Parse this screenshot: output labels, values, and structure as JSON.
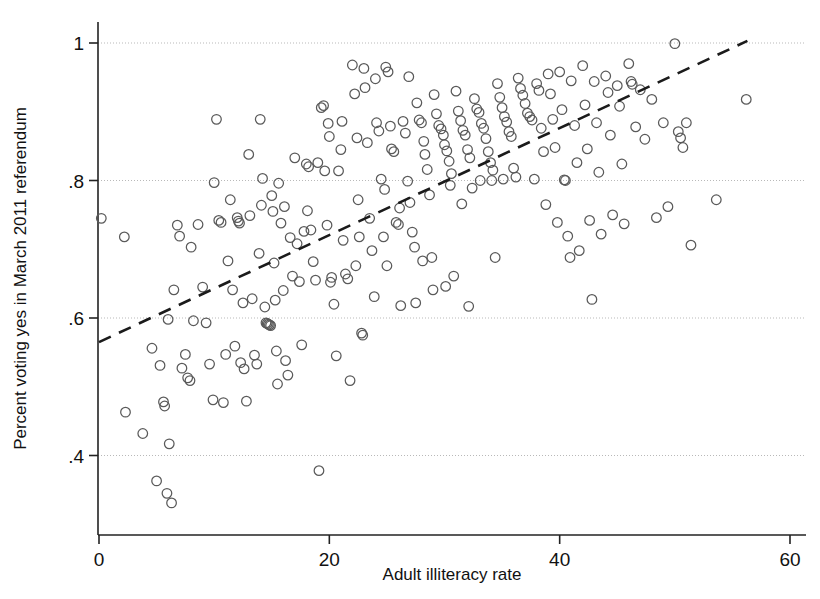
{
  "chart_data": {
    "type": "scatter",
    "title": "",
    "xlabel": "Adult illiteracy rate",
    "ylabel": "Percent voting yes in March 2011 referendum",
    "xlim": [
      -1.2,
      61.5
    ],
    "ylim": [
      0.305,
      1.02
    ],
    "xticks": [
      0,
      20,
      40,
      60
    ],
    "xtick_labels": [
      "0",
      "20",
      "40",
      "60"
    ],
    "yticks": [
      0.4,
      0.6,
      0.8,
      1.0
    ],
    "ytick_labels": [
      ".4",
      ".6",
      ".8",
      "1"
    ],
    "grid": "horizontal-dotted",
    "legend": "none",
    "marker": "open-circle",
    "marker_color": "#5a5a5a",
    "fit_line": {
      "style": "dashed",
      "color": "#1b1b1b",
      "x_start": 0.0,
      "y_start": 0.565,
      "x_end": 56.3,
      "y_end": 1.003
    },
    "points": [
      [
        0.2,
        0.745
      ],
      [
        2.2,
        0.718
      ],
      [
        2.3,
        0.463
      ],
      [
        3.8,
        0.432
      ],
      [
        4.6,
        0.556
      ],
      [
        5.0,
        0.363
      ],
      [
        5.3,
        0.531
      ],
      [
        5.6,
        0.478
      ],
      [
        5.7,
        0.472
      ],
      [
        5.9,
        0.345
      ],
      [
        6.0,
        0.598
      ],
      [
        6.1,
        0.417
      ],
      [
        6.3,
        0.331
      ],
      [
        6.5,
        0.641
      ],
      [
        6.8,
        0.735
      ],
      [
        7.0,
        0.719
      ],
      [
        7.2,
        0.527
      ],
      [
        7.5,
        0.547
      ],
      [
        7.7,
        0.513
      ],
      [
        7.9,
        0.509
      ],
      [
        8.0,
        0.703
      ],
      [
        8.2,
        0.596
      ],
      [
        8.6,
        0.736
      ],
      [
        9.0,
        0.645
      ],
      [
        9.3,
        0.593
      ],
      [
        9.6,
        0.533
      ],
      [
        9.9,
        0.481
      ],
      [
        10.0,
        0.797
      ],
      [
        10.2,
        0.889
      ],
      [
        10.4,
        0.742
      ],
      [
        10.6,
        0.739
      ],
      [
        10.8,
        0.477
      ],
      [
        11.0,
        0.547
      ],
      [
        11.2,
        0.683
      ],
      [
        11.4,
        0.772
      ],
      [
        11.6,
        0.641
      ],
      [
        11.8,
        0.559
      ],
      [
        12.0,
        0.746
      ],
      [
        12.2,
        0.738
      ],
      [
        12.3,
        0.535
      ],
      [
        12.5,
        0.622
      ],
      [
        12.6,
        0.526
      ],
      [
        12.8,
        0.479
      ],
      [
        13.0,
        0.838
      ],
      [
        13.1,
        0.749
      ],
      [
        13.3,
        0.628
      ],
      [
        13.5,
        0.546
      ],
      [
        13.7,
        0.533
      ],
      [
        13.9,
        0.694
      ],
      [
        14.0,
        0.889
      ],
      [
        14.2,
        0.803
      ],
      [
        14.4,
        0.616
      ],
      [
        14.5,
        0.593
      ],
      [
        14.6,
        0.592
      ],
      [
        14.7,
        0.591
      ],
      [
        14.8,
        0.59
      ],
      [
        14.9,
        0.589
      ],
      [
        15.0,
        0.778
      ],
      [
        15.1,
        0.755
      ],
      [
        15.2,
        0.68
      ],
      [
        15.3,
        0.626
      ],
      [
        15.4,
        0.552
      ],
      [
        15.5,
        0.504
      ],
      [
        15.6,
        0.796
      ],
      [
        15.8,
        0.738
      ],
      [
        16.0,
        0.64
      ],
      [
        16.2,
        0.538
      ],
      [
        16.4,
        0.517
      ],
      [
        16.6,
        0.717
      ],
      [
        16.8,
        0.661
      ],
      [
        17.0,
        0.833
      ],
      [
        17.2,
        0.708
      ],
      [
        17.4,
        0.653
      ],
      [
        17.6,
        0.561
      ],
      [
        17.8,
        0.726
      ],
      [
        18.0,
        0.824
      ],
      [
        18.2,
        0.82
      ],
      [
        18.4,
        0.728
      ],
      [
        18.6,
        0.682
      ],
      [
        18.8,
        0.655
      ],
      [
        19.0,
        0.826
      ],
      [
        19.1,
        0.378
      ],
      [
        19.3,
        0.906
      ],
      [
        19.5,
        0.909
      ],
      [
        19.6,
        0.814
      ],
      [
        19.8,
        0.735
      ],
      [
        20.0,
        0.864
      ],
      [
        20.2,
        0.659
      ],
      [
        20.4,
        0.62
      ],
      [
        20.6,
        0.545
      ],
      [
        20.8,
        0.814
      ],
      [
        21.0,
        0.845
      ],
      [
        21.2,
        0.713
      ],
      [
        21.4,
        0.664
      ],
      [
        21.6,
        0.657
      ],
      [
        21.8,
        0.509
      ],
      [
        22.0,
        0.968
      ],
      [
        22.2,
        0.926
      ],
      [
        22.4,
        0.862
      ],
      [
        22.5,
        0.772
      ],
      [
        22.6,
        0.718
      ],
      [
        22.8,
        0.578
      ],
      [
        22.9,
        0.575
      ],
      [
        23.1,
        0.935
      ],
      [
        23.3,
        0.855
      ],
      [
        23.5,
        0.745
      ],
      [
        23.7,
        0.698
      ],
      [
        23.9,
        0.631
      ],
      [
        24.1,
        0.884
      ],
      [
        24.3,
        0.872
      ],
      [
        24.5,
        0.802
      ],
      [
        24.7,
        0.718
      ],
      [
        24.9,
        0.965
      ],
      [
        25.1,
        0.958
      ],
      [
        25.3,
        0.879
      ],
      [
        25.4,
        0.846
      ],
      [
        25.6,
        0.842
      ],
      [
        25.8,
        0.739
      ],
      [
        26.0,
        0.736
      ],
      [
        26.2,
        0.618
      ],
      [
        26.4,
        0.886
      ],
      [
        26.6,
        0.869
      ],
      [
        26.8,
        0.799
      ],
      [
        27.0,
        0.768
      ],
      [
        27.2,
        0.725
      ],
      [
        27.4,
        0.703
      ],
      [
        27.6,
        0.913
      ],
      [
        27.8,
        0.888
      ],
      [
        28.0,
        0.884
      ],
      [
        28.2,
        0.857
      ],
      [
        28.3,
        0.838
      ],
      [
        28.5,
        0.816
      ],
      [
        28.7,
        0.779
      ],
      [
        28.9,
        0.688
      ],
      [
        29.1,
        0.925
      ],
      [
        29.3,
        0.897
      ],
      [
        29.5,
        0.88
      ],
      [
        29.7,
        0.875
      ],
      [
        29.9,
        0.866
      ],
      [
        30.0,
        0.852
      ],
      [
        30.2,
        0.843
      ],
      [
        30.4,
        0.828
      ],
      [
        30.6,
        0.81
      ],
      [
        30.8,
        0.661
      ],
      [
        31.0,
        0.93
      ],
      [
        31.2,
        0.901
      ],
      [
        31.4,
        0.887
      ],
      [
        31.6,
        0.873
      ],
      [
        31.8,
        0.866
      ],
      [
        32.0,
        0.845
      ],
      [
        32.2,
        0.833
      ],
      [
        32.4,
        0.789
      ],
      [
        32.6,
        0.919
      ],
      [
        32.8,
        0.904
      ],
      [
        33.0,
        0.899
      ],
      [
        33.2,
        0.883
      ],
      [
        33.4,
        0.876
      ],
      [
        33.6,
        0.861
      ],
      [
        33.8,
        0.842
      ],
      [
        34.0,
        0.826
      ],
      [
        34.2,
        0.815
      ],
      [
        34.4,
        0.688
      ],
      [
        34.6,
        0.941
      ],
      [
        34.8,
        0.921
      ],
      [
        35.0,
        0.906
      ],
      [
        35.2,
        0.893
      ],
      [
        35.4,
        0.885
      ],
      [
        35.6,
        0.871
      ],
      [
        35.8,
        0.864
      ],
      [
        36.0,
        0.818
      ],
      [
        36.2,
        0.805
      ],
      [
        36.4,
        0.949
      ],
      [
        36.6,
        0.934
      ],
      [
        36.8,
        0.924
      ],
      [
        37.0,
        0.912
      ],
      [
        37.2,
        0.898
      ],
      [
        37.4,
        0.893
      ],
      [
        37.6,
        0.888
      ],
      [
        37.8,
        0.802
      ],
      [
        38.0,
        0.941
      ],
      [
        38.2,
        0.931
      ],
      [
        38.4,
        0.876
      ],
      [
        38.6,
        0.842
      ],
      [
        38.8,
        0.765
      ],
      [
        39.0,
        0.955
      ],
      [
        39.2,
        0.926
      ],
      [
        39.4,
        0.889
      ],
      [
        39.6,
        0.848
      ],
      [
        39.8,
        0.739
      ],
      [
        40.0,
        0.958
      ],
      [
        40.2,
        0.903
      ],
      [
        40.4,
        0.801
      ],
      [
        40.5,
        0.8
      ],
      [
        40.7,
        0.719
      ],
      [
        40.9,
        0.688
      ],
      [
        41.0,
        0.945
      ],
      [
        41.3,
        0.88
      ],
      [
        41.5,
        0.826
      ],
      [
        41.7,
        0.698
      ],
      [
        42.0,
        0.967
      ],
      [
        42.2,
        0.91
      ],
      [
        42.4,
        0.846
      ],
      [
        42.6,
        0.742
      ],
      [
        42.8,
        0.627
      ],
      [
        43.0,
        0.944
      ],
      [
        43.2,
        0.884
      ],
      [
        43.4,
        0.812
      ],
      [
        43.6,
        0.722
      ],
      [
        44.0,
        0.952
      ],
      [
        44.2,
        0.928
      ],
      [
        44.4,
        0.866
      ],
      [
        44.6,
        0.75
      ],
      [
        45.0,
        0.938
      ],
      [
        45.2,
        0.908
      ],
      [
        45.4,
        0.824
      ],
      [
        45.6,
        0.737
      ],
      [
        46.0,
        0.97
      ],
      [
        46.2,
        0.944
      ],
      [
        46.3,
        0.94
      ],
      [
        46.6,
        0.878
      ],
      [
        47.0,
        0.932
      ],
      [
        47.4,
        0.86
      ],
      [
        48.0,
        0.918
      ],
      [
        48.4,
        0.746
      ],
      [
        49.0,
        0.884
      ],
      [
        49.4,
        0.762
      ],
      [
        50.0,
        0.999
      ],
      [
        50.3,
        0.871
      ],
      [
        50.5,
        0.862
      ],
      [
        50.7,
        0.848
      ],
      [
        51.0,
        0.884
      ],
      [
        51.4,
        0.706
      ],
      [
        53.6,
        0.772
      ],
      [
        56.2,
        0.918
      ],
      [
        24.0,
        0.948
      ],
      [
        26.9,
        0.951
      ],
      [
        30.5,
        0.793
      ],
      [
        33.1,
        0.8
      ],
      [
        35.1,
        0.802
      ],
      [
        23.0,
        0.963
      ],
      [
        21.1,
        0.886
      ],
      [
        19.9,
        0.883
      ],
      [
        18.1,
        0.756
      ],
      [
        16.1,
        0.762
      ],
      [
        14.1,
        0.764
      ],
      [
        12.1,
        0.741
      ],
      [
        27.5,
        0.622
      ],
      [
        29.0,
        0.641
      ],
      [
        31.5,
        0.766
      ],
      [
        25.0,
        0.676
      ],
      [
        22.3,
        0.676
      ],
      [
        20.1,
        0.652
      ],
      [
        24.8,
        0.787
      ],
      [
        26.1,
        0.76
      ],
      [
        28.1,
        0.683
      ],
      [
        30.1,
        0.646
      ],
      [
        32.1,
        0.617
      ],
      [
        34.1,
        0.8
      ]
    ]
  }
}
